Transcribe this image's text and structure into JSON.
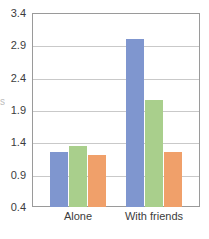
{
  "chart_data": {
    "type": "bar",
    "title": "",
    "subtitle": "",
    "xlabel": "",
    "ylabel": "",
    "categories": [
      "Alone",
      "With friends"
    ],
    "series": [
      {
        "name": "series-1",
        "color": "#7f96cf",
        "values": [
          1.25,
          3.0
        ]
      },
      {
        "name": "series-2",
        "color": "#a9cf8c",
        "values": [
          1.35,
          2.05
        ]
      },
      {
        "name": "series-3",
        "color": "#f0a06a",
        "values": [
          1.2,
          1.25
        ]
      }
    ],
    "ylim": [
      0.4,
      3.4
    ],
    "yticks": [
      "0.4",
      "0.9",
      "1.4",
      "1.9",
      "2.4",
      "2.9",
      "3.4"
    ],
    "ytick_values": [
      0.4,
      0.9,
      1.4,
      1.9,
      2.4,
      2.9,
      3.4
    ],
    "grid": true,
    "grid_axis": "y",
    "legend": "none",
    "legend_position": "none",
    "annotations": []
  },
  "axes": {
    "y": {
      "t0": "0.4",
      "t1": "0.9",
      "t2": "1.4",
      "t3": "1.9",
      "t4": "2.4",
      "t5": "2.9",
      "t6": "3.4"
    },
    "x": {
      "t0": "Alone",
      "t1": "With friends"
    }
  },
  "colors": {
    "series_1": "#7f96cf",
    "series_2": "#a9cf8c",
    "series_3": "#f0a06a",
    "grid": "#c9c9c9",
    "frame": "#9a9a9a",
    "text": "#3c3c3c",
    "background": "#ffffff"
  },
  "artifacts": {
    "edge_glyph": "s",
    "ghost_lines": [
      "",
      "",
      "",
      "",
      ""
    ]
  }
}
